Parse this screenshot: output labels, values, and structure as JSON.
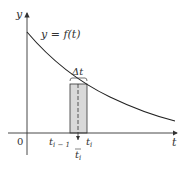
{
  "diagram": {
    "y_axis_label": "y",
    "x_axis_label": "t",
    "origin_label": "0",
    "curve_label": "y = f(t)",
    "delta_label": "Δt",
    "left_tick_label": "t",
    "left_tick_sub": "i − 1",
    "right_tick_label": "t",
    "right_tick_sub": "i",
    "sample_label": "t",
    "sample_sub": "i",
    "colors": {
      "axis": "#333333",
      "curve": "#222222",
      "rect_fill": "#d9d9d9",
      "rect_stroke": "#333333"
    }
  }
}
